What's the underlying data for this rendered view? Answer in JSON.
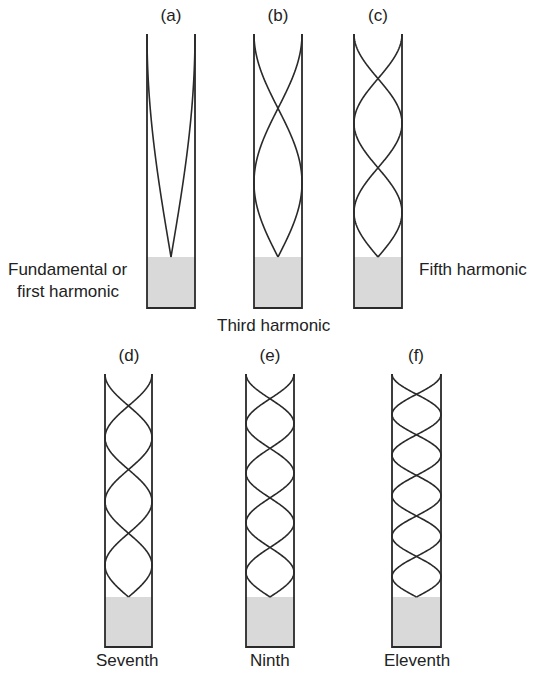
{
  "figure": {
    "colors": {
      "line": "#2a2a2a",
      "water": "#d9d9d9"
    },
    "tubes": [
      {
        "tag": "(a)",
        "harmonic": 1,
        "caption": [
          "Fundamental or",
          "first harmonic"
        ]
      },
      {
        "tag": "(b)",
        "harmonic": 3,
        "caption": [
          "Third harmonic"
        ]
      },
      {
        "tag": "(c)",
        "harmonic": 5,
        "caption": [
          "Fifth harmonic"
        ]
      },
      {
        "tag": "(d)",
        "harmonic": 7,
        "caption": [
          "Seventh"
        ]
      },
      {
        "tag": "(e)",
        "harmonic": 9,
        "caption": [
          "Ninth"
        ]
      },
      {
        "tag": "(f)",
        "harmonic": 11,
        "caption": [
          "Eleventh"
        ]
      }
    ]
  }
}
